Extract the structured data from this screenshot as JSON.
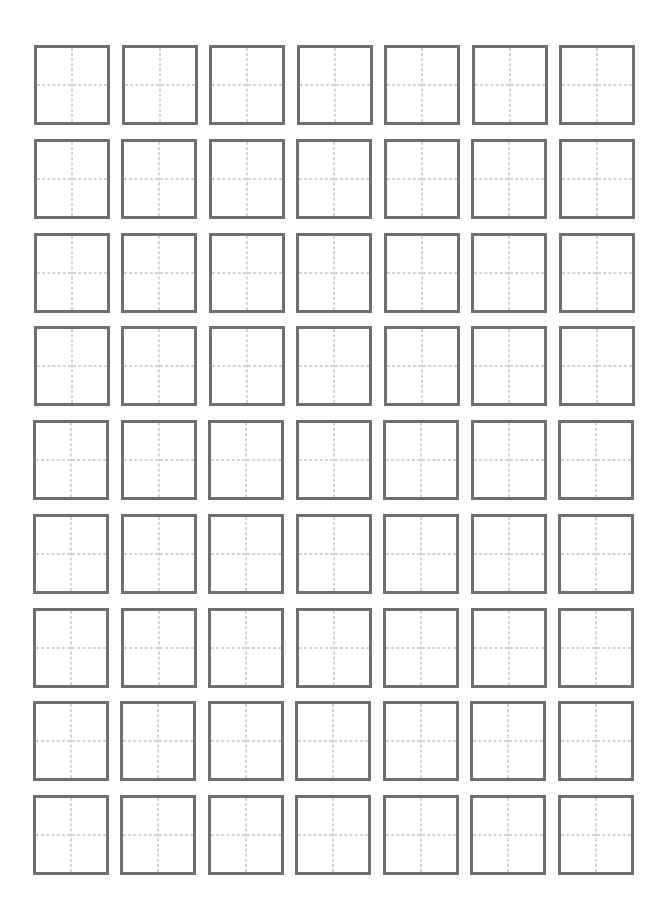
{
  "document": {
    "type": "tianzige-practice-sheet",
    "rows": 9,
    "columns": 7,
    "cell_count": 63,
    "cells_filled": 0,
    "colors": {
      "background": "#ffffff",
      "cell_border": "#6f6f6f",
      "guide_dash": "#a8a8a8"
    },
    "layout": {
      "origin_x": 34,
      "origin_y": 45,
      "cell_width": 76,
      "cell_height": 80,
      "column_pitch": 87.5,
      "row_pitch": 93.75
    }
  }
}
